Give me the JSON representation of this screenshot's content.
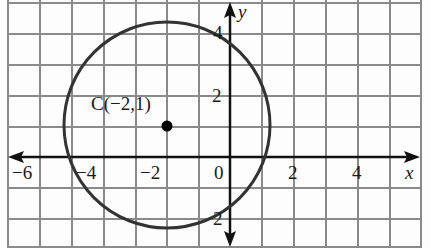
{
  "figure": {
    "type": "coordinate-plane-circle",
    "center_label": "C(−2,1)",
    "center": {
      "x": -2,
      "y": 1
    },
    "radius_units": 3.3,
    "axis_labels": {
      "x": "x",
      "y": "y"
    },
    "x_ticks": [
      {
        "value": -6,
        "label": "−6"
      },
      {
        "value": -4,
        "label": "−4"
      },
      {
        "value": -2,
        "label": "−2"
      },
      {
        "value": 0,
        "label": "0"
      },
      {
        "value": 2,
        "label": "2"
      },
      {
        "value": 4,
        "label": "4"
      }
    ],
    "y_ticks": [
      {
        "value": 4,
        "label": "4"
      },
      {
        "value": 2,
        "label": "2"
      },
      {
        "value": -2,
        "label": "2"
      }
    ],
    "colors": {
      "grid": "#8a8a8a",
      "axis": "#111111",
      "circle": "#333333",
      "point": "#000000"
    }
  }
}
